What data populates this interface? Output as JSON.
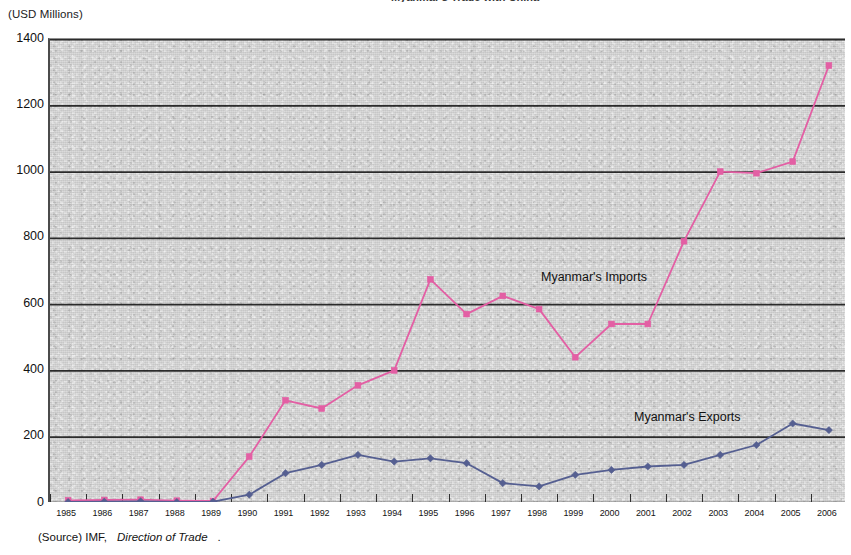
{
  "chart_title": "Myanmar's Trade with China",
  "unit_label": "(USD Millions)",
  "source": {
    "prefix": "(Source) IMF,",
    "publication": "Direction of Trade",
    "suffix": "."
  },
  "annotations": {
    "imports_label": "Myanmar's Imports",
    "exports_label": "Myanmar's Exports"
  },
  "colors": {
    "imports": "#e35fa4",
    "exports": "#555f91",
    "plot_background": "#d3d3d3",
    "gridline": "#1d1d1d",
    "axis": "#3d3d3d"
  },
  "chart_data": {
    "type": "line",
    "title": "Myanmar's Trade with China",
    "xlabel": "",
    "ylabel": "(USD Millions)",
    "ylim": [
      0,
      1400
    ],
    "ytick_step": 200,
    "yticks": [
      0,
      200,
      400,
      600,
      800,
      1000,
      1200,
      1400
    ],
    "grid": true,
    "grid_orientation": "horizontal",
    "legend_position": "inline-annotation",
    "categories": [
      "1985",
      "1986",
      "1987",
      "1988",
      "1989",
      "1990",
      "1991",
      "1992",
      "1993",
      "1994",
      "1995",
      "1996",
      "1997",
      "1998",
      "1999",
      "2000",
      "2001",
      "2002",
      "2003",
      "2004",
      "2005",
      "2006"
    ],
    "series": [
      {
        "name": "Myanmar's Imports",
        "color": "#e35fa4",
        "marker": "square",
        "values": [
          8,
          9,
          10,
          7,
          6,
          140,
          310,
          285,
          355,
          400,
          675,
          570,
          625,
          585,
          440,
          540,
          540,
          790,
          1000,
          995,
          1030,
          1320
        ]
      },
      {
        "name": "Myanmar's Exports",
        "color": "#555f91",
        "marker": "diamond",
        "values": [
          3,
          4,
          5,
          3,
          4,
          25,
          90,
          115,
          145,
          125,
          135,
          120,
          60,
          50,
          85,
          100,
          110,
          115,
          145,
          175,
          240,
          220
        ]
      }
    ]
  }
}
